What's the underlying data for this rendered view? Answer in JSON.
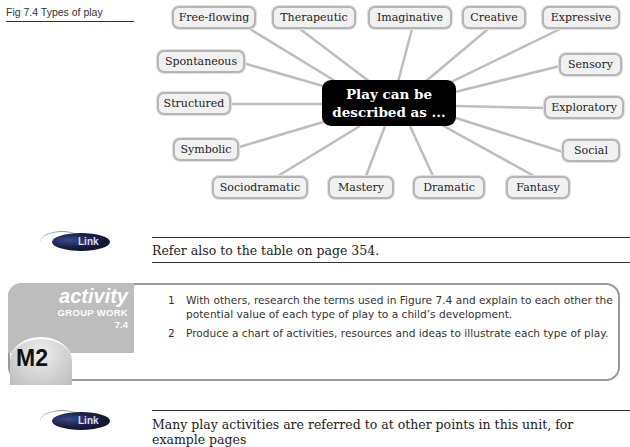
{
  "figure": {
    "caption": "Fig 7.4  Types of play",
    "center_line1": "Play can be",
    "center_line2": "described as ...",
    "nodes": [
      "Free-flowing",
      "Therapeutic",
      "Imaginative",
      "Creative",
      "Expressive",
      "Spontaneous",
      "Sensory",
      "Structured",
      "Exploratory",
      "Symbolic",
      "Social",
      "Sociodramatic",
      "Mastery",
      "Dramatic",
      "Fantasy"
    ]
  },
  "link1": {
    "badge": "Link",
    "text": "Refer also to the table on page 354."
  },
  "activity": {
    "title": "activity",
    "type": "GROUP WORK",
    "number": "7.4",
    "grade": "M2",
    "items": [
      {
        "n": "1",
        "text": "With others, research the terms used in Figure 7.4 and explain to each other the potential value of each type of play to a child’s development."
      },
      {
        "n": "2",
        "text": "Produce a chart of activities, resources and ideas to illustrate each type of play."
      }
    ]
  },
  "link2": {
    "badge": "Link",
    "text": "Many play activities are referred to at other points in this unit, for example pages"
  },
  "colors": {
    "node_border": "#b5b5b5",
    "node_fill": "#f1f1f1",
    "center_fill": "#000000",
    "connector": "#bdbdbd",
    "activity_tab": "#bdbdbd"
  }
}
